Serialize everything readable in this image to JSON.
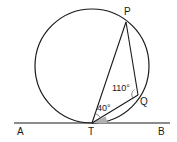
{
  "diagram": {
    "type": "circle-tangent-geometry",
    "points": {
      "P": "P",
      "Q": "Q",
      "T": "T",
      "A": "A",
      "B": "B"
    },
    "angles": {
      "PQT": "110°",
      "PTQ": "40°"
    },
    "shaded_angle": "QTB",
    "colors": {
      "line": "#1a1a1a",
      "shade": "#b0b0b0",
      "background": "#ffffff"
    }
  }
}
